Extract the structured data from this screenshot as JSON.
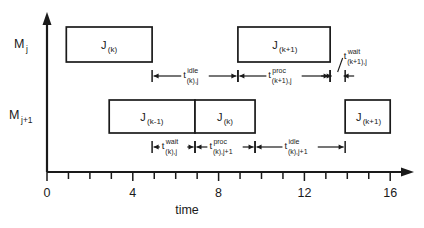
{
  "figure": {
    "title": "",
    "axis": {
      "x_title": "time",
      "x_ticks_labeled": [
        "0",
        "4",
        "8",
        "12",
        "16"
      ],
      "x_tick_values": [
        0,
        4,
        8,
        12,
        16
      ],
      "x_minor_step": 1,
      "x_min": 0,
      "x_max": 16.6
    },
    "rows": [
      {
        "id": "machine-j",
        "label_main": "M",
        "label_sub": "j"
      },
      {
        "id": "machine-j-plus-1",
        "label_main": "M",
        "label_sub": "j+1"
      }
    ]
  },
  "chart_data": {
    "type": "bar",
    "title": "",
    "xlabel": "time",
    "ylabel": "",
    "xlim": [
      0,
      16.6
    ],
    "grid": false,
    "legend": "none",
    "categories": [
      "M j",
      "M j+1"
    ],
    "series": [
      {
        "name": "M j",
        "row": 0,
        "bars": [
          {
            "label_main": "J",
            "label_sub": "(k)",
            "start": 0.9,
            "end": 4.9
          },
          {
            "label_main": "J",
            "label_sub": "(k+1)",
            "start": 8.9,
            "end": 13.2
          }
        ]
      },
      {
        "name": "M j+1",
        "row": 1,
        "bars": [
          {
            "label_main": "J",
            "label_sub": "(k-1)",
            "start": 2.9,
            "end": 6.9
          },
          {
            "label_main": "J",
            "label_sub": "(k)",
            "start": 6.9,
            "end": 9.7
          },
          {
            "label_main": "J",
            "label_sub": "(k+1)",
            "start": 13.9,
            "end": 16.0
          }
        ]
      }
    ],
    "measurements": [
      {
        "id": "t-idle-k-j",
        "row": 0,
        "base": "t",
        "sup": "idle",
        "sub": "(k),j",
        "start": 4.9,
        "end": 8.9,
        "style": "inline"
      },
      {
        "id": "t-proc-k-plus-1-j",
        "row": 0,
        "base": "t",
        "sup": "proc",
        "sub": "(k+1),j",
        "start": 8.9,
        "end": 13.2,
        "style": "inline"
      },
      {
        "id": "t-wait-k-plus-1-j",
        "row": 0,
        "base": "t",
        "sup": "wait",
        "sub": "(k+1),j",
        "start": 13.2,
        "end": 13.9,
        "style": "leader"
      },
      {
        "id": "t-wait-k-j",
        "row": 1,
        "base": "t",
        "sup": "wait",
        "sub": "(k),j",
        "start": 4.9,
        "end": 6.9,
        "style": "inline"
      },
      {
        "id": "t-proc-k-j-plus-1",
        "row": 1,
        "base": "t",
        "sup": "proc",
        "sub": "(k),j+1",
        "start": 6.9,
        "end": 9.7,
        "style": "inline"
      },
      {
        "id": "t-idle-k-j-plus-1",
        "row": 1,
        "base": "t",
        "sup": "idle",
        "sub": "(k),j+1",
        "start": 9.7,
        "end": 13.9,
        "style": "inline"
      }
    ]
  }
}
